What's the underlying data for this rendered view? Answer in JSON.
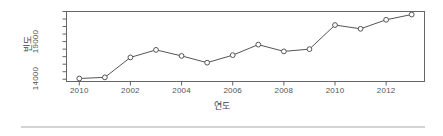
{
  "chart_data": {
    "type": "line",
    "title": "",
    "xlabel": "연도",
    "ylabel": "빈도",
    "x": [
      2000,
      2001,
      2002,
      2003,
      2004,
      2005,
      2006,
      2007,
      2008,
      2009,
      2010,
      2011,
      2012,
      2013
    ],
    "values": [
      14100,
      14250,
      16900,
      17900,
      17100,
      16200,
      17200,
      18600,
      17700,
      18000,
      21200,
      20700,
      21900,
      22600
    ],
    "categories": [
      "2000",
      "2001",
      "2002",
      "2003",
      "2004",
      "2005",
      "2006",
      "2007",
      "2008",
      "2009",
      "2010",
      "2011",
      "2012",
      "2013"
    ],
    "xticks": [
      {
        "label": "2010",
        "value": 2000
      },
      {
        "label": "2002",
        "value": 2002
      },
      {
        "label": "2004",
        "value": 2004
      },
      {
        "label": "2006",
        "value": 2006
      },
      {
        "label": "2008",
        "value": 2008
      },
      {
        "label": "2010",
        "value": 2010
      },
      {
        "label": "2012",
        "value": 2012
      }
    ],
    "yticks": [
      {
        "label": "",
        "value": 13000
      },
      {
        "label": "14000",
        "value": 14000
      },
      {
        "label": "",
        "value": 15000
      },
      {
        "label": "",
        "value": 16000
      },
      {
        "label": "",
        "value": 17000
      },
      {
        "label": "",
        "value": 18000
      },
      {
        "label": "19000",
        "value": 19000
      },
      {
        "label": "",
        "value": 20000
      },
      {
        "label": "",
        "value": 21000
      },
      {
        "label": "",
        "value": 22000
      },
      {
        "label": "",
        "value": 23000
      }
    ],
    "xlim": [
      1999.5,
      2013.5
    ],
    "ylim": [
      13700,
      23000
    ],
    "grid": false,
    "legend": false,
    "marker": "circle-open",
    "line_color": "#555555",
    "marker_color": "#555555",
    "frame_color": "#666666",
    "background": "#ffffff"
  },
  "figure": {
    "rule_color": "#d4d4d4"
  }
}
